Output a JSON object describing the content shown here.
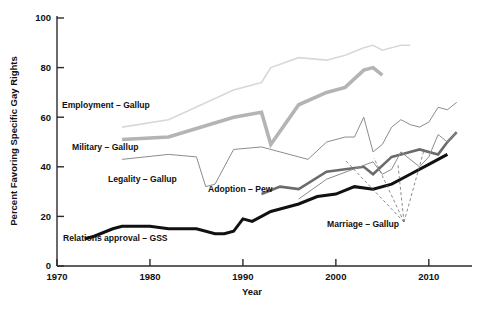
{
  "chart_data": {
    "type": "line",
    "title": "",
    "xlabel": "Year",
    "ylabel": "Percent Favoring Specific Gay Rights",
    "xlim": [
      1970,
      2014
    ],
    "ylim": [
      0,
      100
    ],
    "xticks": [
      1970,
      1980,
      1990,
      2000,
      2010
    ],
    "yticks": [
      0,
      20,
      40,
      60,
      80,
      100
    ],
    "grid": false,
    "legend_position": "inline-annotations",
    "series": [
      {
        "name": "Employment - Gallup",
        "label": "Employment – Gallup",
        "color": "#d8d8d8",
        "width": 1.6,
        "x": [
          1977,
          1982,
          1989,
          1992,
          1993,
          1996,
          1999,
          2001,
          2003,
          2004,
          2005,
          2007,
          2008
        ],
        "values": [
          56,
          59,
          71,
          74,
          80,
          84,
          83,
          85,
          88,
          89,
          87,
          89,
          89
        ]
      },
      {
        "name": "Military - Gallup",
        "label": "Military – Gallup",
        "color": "#b4b4b4",
        "width": 3.6,
        "x": [
          1977,
          1982,
          1989,
          1992,
          1993,
          1996,
          1999,
          2001,
          2003,
          2004,
          2005
        ],
        "values": [
          51,
          52,
          60,
          62,
          49,
          65,
          70,
          72,
          79,
          80,
          77
        ]
      },
      {
        "name": "Legality - Gallup",
        "label": "Legality – Gallup",
        "color": "#8c8c8c",
        "width": 1.0,
        "x": [
          1977,
          1982,
          1985,
          1986,
          1987,
          1989,
          1992,
          1996,
          1997,
          1999,
          2001,
          2002,
          2003,
          2004,
          2005,
          2006,
          2007,
          2008,
          2009,
          2010,
          2011,
          2012,
          2013
        ],
        "values": [
          43,
          45,
          44,
          32,
          33,
          47,
          48,
          44,
          43,
          50,
          52,
          52,
          60,
          46,
          49,
          56,
          59,
          57,
          56,
          58,
          64,
          63,
          66
        ]
      },
      {
        "name": "Adoption - Pew",
        "label": "Adoption – Pew",
        "color": "#6b6b6b",
        "width": 2.6,
        "x": [
          1992,
          1994,
          1996,
          1999,
          2001,
          2003,
          2004,
          2006,
          2007,
          2009,
          2011,
          2012,
          2013
        ],
        "values": [
          29,
          32,
          31,
          38,
          39,
          40,
          37,
          44,
          45,
          47,
          45,
          50,
          54
        ]
      },
      {
        "name": "Relations approval - GSS",
        "label": "Relations approval – GSS",
        "color": "#111111",
        "width": 3.0,
        "x": [
          1973,
          1974,
          1976,
          1977,
          1980,
          1982,
          1984,
          1985,
          1987,
          1988,
          1989,
          1990,
          1991,
          1993,
          1994,
          1996,
          1998,
          2000,
          2002,
          2004,
          2006,
          2008,
          2010,
          2012
        ],
        "values": [
          11,
          12,
          15,
          16,
          16,
          15,
          15,
          15,
          13,
          13,
          14,
          19,
          18,
          22,
          23,
          25,
          28,
          29,
          32,
          31,
          33,
          37,
          41,
          45
        ]
      },
      {
        "name": "Marriage - Gallup",
        "label": "Marriage – Gallup",
        "color": "#8c8c8c",
        "width": 1.0,
        "x": [
          1996,
          1999,
          2004,
          2005,
          2006,
          2007,
          2009,
          2010,
          2011,
          2012,
          2013
        ],
        "values": [
          27,
          35,
          42,
          37,
          39,
          46,
          40,
          44,
          53,
          50,
          54
        ]
      }
    ],
    "annotations": [
      {
        "name": "employment-label",
        "text": "Employment – Gallup",
        "x_px": 62,
        "y_px": 108
      },
      {
        "name": "military-label",
        "text": "Military – Gallup",
        "x_px": 72,
        "y_px": 150
      },
      {
        "name": "legality-label",
        "text": "Legality – Gallup",
        "x_px": 108,
        "y_px": 182
      },
      {
        "name": "adoption-label",
        "text": "Adoption – Pew",
        "x_px": 208,
        "y_px": 192
      },
      {
        "name": "marriage-label",
        "text": "Marriage – Gallup",
        "x_px": 327,
        "y_px": 227
      },
      {
        "name": "gss-label",
        "text": "Relations approval – GSS",
        "x_px": 63,
        "y_px": 241
      }
    ]
  }
}
